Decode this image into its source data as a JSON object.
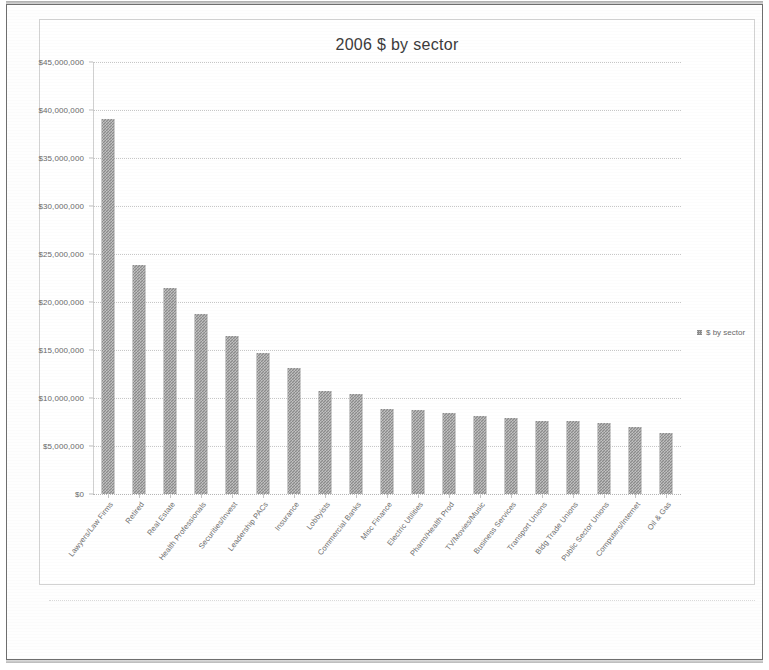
{
  "chart_data": {
    "type": "bar",
    "title": "2006 $ by sector",
    "xlabel": "",
    "ylabel": "",
    "ylim": [
      0,
      45000000
    ],
    "ytick_step": 5000000,
    "grid": true,
    "legend_position": "right",
    "series_name": "$ by sector",
    "bar_color": "#8b8b8b",
    "categories": [
      "Lawyers/Law Firms",
      "Retired",
      "Real Estate",
      "Health Professionals",
      "Securities/Invest",
      "Leadership PACs",
      "Insurance",
      "Lobbyists",
      "Commercial Banks",
      "Misc Finance",
      "Electric Utilities",
      "Pharm/Health Prod",
      "TV/Movies/Music",
      "Business Services",
      "Transport Unions",
      "Bldg Trade Unions",
      "Public Sector Unions",
      "Computers/Internet",
      "Oil & Gas"
    ],
    "values": [
      39100000,
      23900000,
      21500000,
      18700000,
      16500000,
      14700000,
      13100000,
      10700000,
      10400000,
      8900000,
      8800000,
      8400000,
      8100000,
      7900000,
      7600000,
      7600000,
      7400000,
      7000000,
      6400000
    ],
    "ytick_labels": [
      "$0",
      "$5,000,000",
      "$10,000,000",
      "$15,000,000",
      "$20,000,000",
      "$25,000,000",
      "$30,000,000",
      "$35,000,000",
      "$40,000,000",
      "$45,000,000"
    ],
    "ytick_values": [
      0,
      5000000,
      10000000,
      15000000,
      20000000,
      25000000,
      30000000,
      35000000,
      40000000,
      45000000
    ]
  },
  "legend": {
    "entries": [
      {
        "label": "$ by sector",
        "color": "#8b8b8b"
      }
    ]
  }
}
